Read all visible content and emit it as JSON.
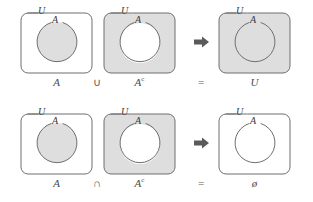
{
  "figure": {
    "name": "complement-set-identities",
    "background_color": "#ffffff",
    "shade_color": "#dedede",
    "stroke_color": "#6f6f6f",
    "label_color": "#4a4a4a"
  },
  "rows": [
    {
      "id": "union-identity",
      "operator": "∪",
      "equals": "=",
      "arrow": "arrow-right-icon",
      "cells": [
        {
          "id": "set-a",
          "universe_label": "U",
          "circle_label": "A",
          "caption": "A",
          "caption_superscript": "",
          "region_shaded": "inside-circle"
        },
        {
          "id": "set-a-complement",
          "universe_label": "U",
          "circle_label": "A",
          "caption": "A",
          "caption_superscript": "c",
          "region_shaded": "outside-circle"
        },
        {
          "id": "result-universe",
          "universe_label": "U",
          "circle_label": "A",
          "caption": "U",
          "caption_superscript": "",
          "region_shaded": "all"
        }
      ]
    },
    {
      "id": "intersection-identity",
      "operator": "∩",
      "equals": "=",
      "arrow": "arrow-right-icon",
      "cells": [
        {
          "id": "set-a",
          "universe_label": "U",
          "circle_label": "A",
          "caption": "A",
          "caption_superscript": "",
          "region_shaded": "inside-circle"
        },
        {
          "id": "set-a-complement",
          "universe_label": "U",
          "circle_label": "A",
          "caption": "A",
          "caption_superscript": "c",
          "region_shaded": "outside-circle"
        },
        {
          "id": "result-empty-set",
          "universe_label": "U",
          "circle_label": "A",
          "caption": "ø",
          "caption_superscript": "",
          "region_shaded": "none"
        }
      ]
    }
  ]
}
